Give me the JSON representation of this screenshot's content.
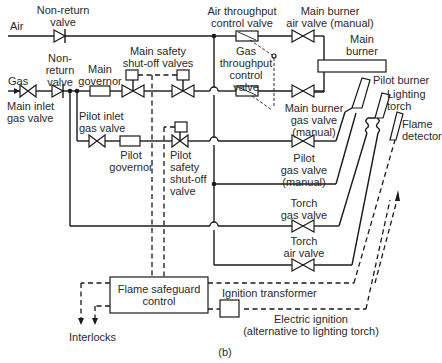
{
  "figure": {
    "caption": "(b)",
    "inputs": {
      "air": "Air",
      "gas": "Gas"
    },
    "labels": {
      "air_non_return_valve": "Non-return\nvalve",
      "gas_non_return_valve": "Non-\nreturn\nvalve",
      "main_inlet_gas_valve": "Main inlet\ngas valve",
      "main_governor": "Main\ngovernor",
      "main_safety_shutoff_valves": "Main safety\nshut-off valves",
      "air_throughput_control_valve": "Air throughput\ncontrol valve",
      "gas_throughput_control_valve": "Gas\nthroughput\ncontrol\nvalve",
      "main_burner_air_valve": "Main burner\nair valve (manual)",
      "main_burner": "Main\nburner",
      "main_burner_gas_valve": "Main burner\ngas valve\n(manual)",
      "pilot_burner": "Pilot burner",
      "lighting_torch": "Lighting\ntorch",
      "flame_detector": "Flame\ndetector",
      "pilot_inlet_gas_valve": "Pilot inlet\ngas valve",
      "pilot_governor": "Pilot\ngovernor",
      "pilot_safety_shutoff_valve": "Pilot\nsafety\nshut-off\nvalve",
      "pilot_gas_valve": "Pilot\ngas valve\n(manual)",
      "torch_gas_valve": "Torch\ngas valve",
      "torch_air_valve": "Torch\nair valve",
      "flame_safeguard_control": "Flame safeguard\ncontrol",
      "ignition_transformer": "Ignition transformer",
      "electric_ignition": "Electric ignition\n(alternative to lighting torch)",
      "interlocks": "Interlocks"
    },
    "colors": {
      "line": "#1a1a1a",
      "text": "#2a2a2a",
      "background": "#ffffff"
    }
  }
}
